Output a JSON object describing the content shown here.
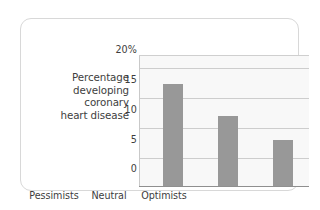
{
  "chart_data": {
    "type": "bar",
    "title": "",
    "subtitle": "",
    "xlabel": "",
    "ylabel": "Percentage developing coronary heart disease",
    "ylabel_lines": [
      "Percentage",
      "developing",
      "coronary",
      "heart disease"
    ],
    "categories": [
      "Pessimists",
      "Neutral",
      "Optimists"
    ],
    "values": [
      17.2,
      11.7,
      7.7
    ],
    "ytick_labels": [
      "20%",
      "15",
      "10",
      "5",
      "0"
    ],
    "ytick_values": [
      20,
      15,
      10,
      5,
      0
    ],
    "ylim": [
      0,
      22
    ],
    "grid": true,
    "legend": false,
    "legend_position": "none",
    "bar_color": "#989898",
    "plot_background": "#f8f8f8",
    "gridline_color": "#cdcdcd",
    "axis_color": "#8f8f8f",
    "frame_color": "#d8d8d8",
    "text_color": "#3d3d3d"
  }
}
